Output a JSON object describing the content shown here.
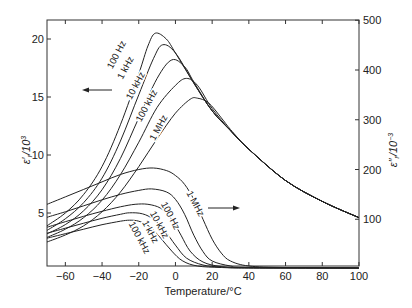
{
  "chart_data": {
    "type": "line",
    "title": "",
    "xlabel": "Temperature/°C",
    "ylabel_left": "ε′r/10³",
    "ylabel_right": "ε″r/10⁻³",
    "xlim": [
      -70,
      100
    ],
    "ylim_left": [
      0,
      22
    ],
    "ylim_right": [
      0,
      500
    ],
    "x_ticks": [
      -60,
      -40,
      -20,
      0,
      20,
      40,
      60,
      80,
      100
    ],
    "y_ticks_left": [
      5,
      10,
      15,
      20
    ],
    "y_ticks_right": [
      100,
      200,
      300,
      400,
      500
    ],
    "grid": false,
    "legend": "inline curve labels",
    "annotations": [
      {
        "text": "←",
        "meaning": "arrow pointing to left axis (ε′ curves)",
        "x": -30,
        "y_left": 15.5
      },
      {
        "text": "→",
        "meaning": "arrow pointing to right axis (ε″ curves)",
        "x": 20,
        "y_left": 5.4
      }
    ],
    "series_permittivity": [
      {
        "name": "100 Hz",
        "axis": "left",
        "points": [
          [
            -70,
            3.9
          ],
          [
            -60,
            5.0
          ],
          [
            -50,
            6.6
          ],
          [
            -40,
            9.0
          ],
          [
            -30,
            12.6
          ],
          [
            -20,
            17.0
          ],
          [
            -15,
            19.4
          ],
          [
            -11,
            20.5
          ],
          [
            -5,
            20.0
          ],
          [
            0,
            18.8
          ],
          [
            10,
            16.2
          ],
          [
            20,
            13.8
          ],
          [
            30,
            12.1
          ],
          [
            40,
            10.5
          ],
          [
            60,
            7.8
          ],
          [
            80,
            6.0
          ],
          [
            100,
            4.6
          ]
        ]
      },
      {
        "name": "1 kHz",
        "axis": "left",
        "points": [
          [
            -70,
            3.5
          ],
          [
            -60,
            4.5
          ],
          [
            -50,
            5.9
          ],
          [
            -40,
            8.0
          ],
          [
            -30,
            11.2
          ],
          [
            -20,
            15.2
          ],
          [
            -12,
            18.3
          ],
          [
            -7,
            19.5
          ],
          [
            0,
            18.8
          ],
          [
            10,
            16.2
          ],
          [
            20,
            13.8
          ],
          [
            30,
            12.1
          ],
          [
            40,
            10.5
          ],
          [
            60,
            7.8
          ],
          [
            80,
            6.0
          ],
          [
            100,
            4.6
          ]
        ]
      },
      {
        "name": "10 kHz",
        "axis": "left",
        "points": [
          [
            -70,
            3.2
          ],
          [
            -60,
            4.0
          ],
          [
            -50,
            5.2
          ],
          [
            -40,
            7.0
          ],
          [
            -30,
            9.7
          ],
          [
            -20,
            13.2
          ],
          [
            -10,
            16.6
          ],
          [
            -2,
            18.2
          ],
          [
            5,
            17.6
          ],
          [
            10,
            16.3
          ],
          [
            20,
            13.8
          ],
          [
            30,
            12.1
          ],
          [
            40,
            10.5
          ],
          [
            60,
            7.8
          ],
          [
            80,
            6.0
          ],
          [
            100,
            4.6
          ]
        ]
      },
      {
        "name": "100 kHz",
        "axis": "left",
        "points": [
          [
            -70,
            2.9
          ],
          [
            -60,
            3.6
          ],
          [
            -50,
            4.6
          ],
          [
            -40,
            6.1
          ],
          [
            -30,
            8.3
          ],
          [
            -20,
            11.1
          ],
          [
            -10,
            14.1
          ],
          [
            0,
            16.0
          ],
          [
            6,
            16.6
          ],
          [
            12,
            16.0
          ],
          [
            20,
            14.0
          ],
          [
            30,
            12.1
          ],
          [
            40,
            10.5
          ],
          [
            60,
            7.8
          ],
          [
            80,
            6.0
          ],
          [
            100,
            4.6
          ]
        ]
      },
      {
        "name": "1 MHz",
        "axis": "left",
        "points": [
          [
            -70,
            2.5
          ],
          [
            -60,
            3.1
          ],
          [
            -50,
            3.9
          ],
          [
            -40,
            5.1
          ],
          [
            -30,
            6.8
          ],
          [
            -20,
            9.0
          ],
          [
            -10,
            11.4
          ],
          [
            0,
            13.6
          ],
          [
            8,
            14.8
          ],
          [
            12,
            14.9
          ],
          [
            18,
            14.5
          ],
          [
            25,
            13.2
          ],
          [
            30,
            12.2
          ],
          [
            40,
            10.5
          ],
          [
            60,
            7.8
          ],
          [
            80,
            6.0
          ],
          [
            100,
            4.6
          ]
        ]
      }
    ],
    "series_loss": [
      {
        "name": "1 MHz",
        "axis": "right",
        "points": [
          [
            -70,
            130
          ],
          [
            -60,
            145
          ],
          [
            -50,
            160
          ],
          [
            -40,
            175
          ],
          [
            -30,
            190
          ],
          [
            -20,
            200
          ],
          [
            -12,
            203
          ],
          [
            -5,
            198
          ],
          [
            0,
            188
          ],
          [
            5,
            170
          ],
          [
            10,
            140
          ],
          [
            15,
            100
          ],
          [
            20,
            60
          ],
          [
            25,
            32
          ],
          [
            30,
            16
          ],
          [
            40,
            6
          ],
          [
            60,
            3
          ],
          [
            100,
            2
          ]
        ]
      },
      {
        "name": "100 Hz",
        "axis": "right",
        "points": [
          [
            -70,
            104
          ],
          [
            -60,
            115
          ],
          [
            -50,
            127
          ],
          [
            -40,
            139
          ],
          [
            -30,
            150
          ],
          [
            -20,
            158
          ],
          [
            -13,
            161
          ],
          [
            -5,
            155
          ],
          [
            0,
            140
          ],
          [
            5,
            110
          ],
          [
            10,
            68
          ],
          [
            15,
            35
          ],
          [
            20,
            16
          ],
          [
            30,
            6
          ],
          [
            40,
            3
          ],
          [
            100,
            2
          ]
        ]
      },
      {
        "name": "10 kHz",
        "axis": "right",
        "points": [
          [
            -70,
            84
          ],
          [
            -60,
            95
          ],
          [
            -50,
            106
          ],
          [
            -40,
            116
          ],
          [
            -30,
            125
          ],
          [
            -22,
            130
          ],
          [
            -15,
            130
          ],
          [
            -8,
            122
          ],
          [
            -2,
            100
          ],
          [
            3,
            68
          ],
          [
            8,
            36
          ],
          [
            15,
            14
          ],
          [
            25,
            5
          ],
          [
            40,
            3
          ],
          [
            100,
            2
          ]
        ]
      },
      {
        "name": "1 kHz",
        "axis": "right",
        "points": [
          [
            -70,
            72
          ],
          [
            -60,
            82
          ],
          [
            -50,
            92
          ],
          [
            -40,
            102
          ],
          [
            -30,
            110
          ],
          [
            -25,
            113
          ],
          [
            -18,
            111
          ],
          [
            -12,
            100
          ],
          [
            -6,
            78
          ],
          [
            0,
            48
          ],
          [
            6,
            22
          ],
          [
            15,
            8
          ],
          [
            25,
            4
          ],
          [
            40,
            2
          ],
          [
            100,
            2
          ]
        ]
      },
      {
        "name": "100 kHz",
        "axis": "right",
        "points": [
          [
            -70,
            62
          ],
          [
            -60,
            71
          ],
          [
            -50,
            80
          ],
          [
            -40,
            89
          ],
          [
            -30,
            96
          ],
          [
            -25,
            98
          ],
          [
            -20,
            96
          ],
          [
            -14,
            85
          ],
          [
            -8,
            62
          ],
          [
            -2,
            36
          ],
          [
            4,
            16
          ],
          [
            12,
            6
          ],
          [
            25,
            3
          ],
          [
            40,
            2
          ],
          [
            100,
            2
          ]
        ]
      }
    ],
    "labels_permittivity": [
      {
        "text": "100 Hz",
        "x": 117,
        "y": 55,
        "angle": -62
      },
      {
        "text": "1 kHz",
        "x": 126,
        "y": 68,
        "angle": -62
      },
      {
        "text": "10 kHz",
        "x": 136,
        "y": 86,
        "angle": -62
      },
      {
        "text": "100 kHz",
        "x": 147,
        "y": 106,
        "angle": -62
      },
      {
        "text": "1 MHz",
        "x": 159,
        "y": 128,
        "angle": -62
      }
    ],
    "labels_loss": [
      {
        "text": "1 MHz",
        "x": 195,
        "y": 204,
        "angle": 62
      },
      {
        "text": "100 Hz",
        "x": 170,
        "y": 216,
        "angle": 62
      },
      {
        "text": "10 kHz",
        "x": 159,
        "y": 225,
        "angle": 62
      },
      {
        "text": "1 kHz",
        "x": 150,
        "y": 232,
        "angle": 62
      },
      {
        "text": "100 kHz",
        "x": 139,
        "y": 238,
        "angle": 62
      }
    ]
  }
}
